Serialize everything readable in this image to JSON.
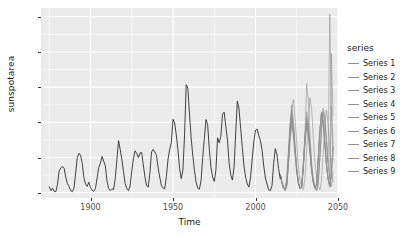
{
  "chart_data": {
    "type": "line",
    "title": "",
    "xlabel": "Time",
    "ylabel": "sunspotarea",
    "xlim": [
      1870,
      2050
    ],
    "ylim": [
      -150,
      5250
    ],
    "grid": true,
    "legend_position": "right",
    "legend_title": "series",
    "panel_background": "#ebebeb",
    "gridline_color": "#ffffff",
    "historical_color": "#222222",
    "forecast_color": "#8f8f8f",
    "x_ticks": [
      1900,
      1950,
      2000,
      2050
    ],
    "x_tick_labels": [
      "1900",
      "1950",
      "2000",
      "2050"
    ],
    "y_ticks": [
      0,
      1000,
      2000,
      3000,
      4000,
      5000
    ],
    "y_tick_labels": [
      "0",
      "1000",
      "2000",
      "3000",
      "4000",
      "5000"
    ],
    "legend_entries": [
      {
        "label": "Series 1",
        "color": "#8f8f8f"
      },
      {
        "label": "Series 2",
        "color": "#8f8f8f"
      },
      {
        "label": "Series 3",
        "color": "#8f8f8f"
      },
      {
        "label": "Series 4",
        "color": "#8f8f8f"
      },
      {
        "label": "Series 5",
        "color": "#8f8f8f"
      },
      {
        "label": "Series 6",
        "color": "#8f8f8f"
      },
      {
        "label": "Series 7",
        "color": "#8f8f8f"
      },
      {
        "label": "Series 8",
        "color": "#8f8f8f"
      },
      {
        "label": "Series 9",
        "color": "#8f8f8f"
      }
    ],
    "historical": {
      "name": "Observed sunspot area",
      "x": [
        1875,
        1876,
        1877,
        1878,
        1879,
        1880,
        1881,
        1882,
        1883,
        1884,
        1885,
        1886,
        1887,
        1888,
        1889,
        1890,
        1891,
        1892,
        1893,
        1894,
        1895,
        1896,
        1897,
        1898,
        1899,
        1900,
        1901,
        1902,
        1903,
        1904,
        1905,
        1906,
        1907,
        1908,
        1909,
        1910,
        1911,
        1912,
        1913,
        1914,
        1915,
        1916,
        1917,
        1918,
        1919,
        1920,
        1921,
        1922,
        1923,
        1924,
        1925,
        1926,
        1927,
        1928,
        1929,
        1930,
        1931,
        1932,
        1933,
        1934,
        1935,
        1936,
        1937,
        1938,
        1939,
        1940,
        1941,
        1942,
        1943,
        1944,
        1945,
        1946,
        1947,
        1948,
        1949,
        1950,
        1951,
        1952,
        1953,
        1954,
        1955,
        1956,
        1957,
        1958,
        1959,
        1960,
        1961,
        1962,
        1963,
        1964,
        1965,
        1966,
        1967,
        1968,
        1969,
        1970,
        1971,
        1972,
        1973,
        1974,
        1975,
        1976,
        1977,
        1978,
        1979,
        1980,
        1981,
        1982,
        1983,
        1984,
        1985,
        1986,
        1987,
        1988,
        1989,
        1990,
        1991,
        1992,
        1993,
        1994,
        1995,
        1996,
        1997,
        1998,
        1999,
        2000,
        2001,
        2002,
        2003,
        2004,
        2005,
        2006,
        2007,
        2008,
        2009,
        2010,
        2011,
        2012,
        2013,
        2014,
        2015
      ],
      "y": [
        170,
        60,
        130,
        40,
        30,
        240,
        620,
        700,
        750,
        700,
        440,
        260,
        180,
        60,
        30,
        130,
        560,
        1000,
        1120,
        1060,
        830,
        430,
        240,
        180,
        300,
        150,
        70,
        40,
        120,
        420,
        720,
        840,
        1030,
        900,
        760,
        330,
        120,
        60,
        110,
        90,
        400,
        940,
        1480,
        1230,
        950,
        600,
        260,
        120,
        60,
        190,
        620,
        960,
        1190,
        1120,
        1000,
        1130,
        1140,
        790,
        450,
        200,
        160,
        560,
        1160,
        1230,
        1150,
        1060,
        700,
        430,
        200,
        130,
        110,
        460,
        960,
        1230,
        1420,
        2090,
        1980,
        1640,
        1220,
        680,
        400,
        640,
        1640,
        3070,
        2970,
        2230,
        1560,
        1050,
        640,
        300,
        130,
        100,
        350,
        1000,
        1540,
        2080,
        1930,
        1240,
        720,
        450,
        320,
        640,
        1560,
        1420,
        1600,
        2230,
        2290,
        1890,
        1500,
        850,
        500,
        360,
        720,
        1700,
        2600,
        2390,
        1830,
        1290,
        760,
        440,
        250,
        160,
        440,
        960,
        1450,
        1780,
        1810,
        1620,
        1480,
        1200,
        760,
        420,
        240,
        80,
        60,
        200,
        830,
        1250,
        1090,
        680,
        400,
        520
      ]
    },
    "forecast_series": [
      {
        "name": "Series 1",
        "x": [
          2015,
          2016,
          2017,
          2018,
          2019,
          2020,
          2021,
          2022,
          2023,
          2024,
          2025,
          2026,
          2027,
          2028,
          2029,
          2030,
          2031,
          2032,
          2033,
          2034,
          2035,
          2036,
          2037,
          2038,
          2039,
          2040,
          2041,
          2042,
          2043,
          2044,
          2045,
          2046,
          2047
        ],
        "y": [
          520,
          300,
          140,
          60,
          240,
          900,
          1700,
          2380,
          2650,
          2100,
          1400,
          760,
          360,
          150,
          90,
          420,
          1200,
          2000,
          2700,
          2400,
          1600,
          900,
          420,
          180,
          80,
          320,
          1100,
          1900,
          2350,
          1900,
          1250,
          700,
          300
        ]
      },
      {
        "name": "Series 2",
        "x": [
          2015,
          2016,
          2017,
          2018,
          2019,
          2020,
          2021,
          2022,
          2023,
          2024,
          2025,
          2026,
          2027,
          2028,
          2029,
          2030,
          2031,
          2032,
          2033,
          2034,
          2035,
          2036,
          2037,
          2038,
          2039,
          2040,
          2041,
          2042,
          2043,
          2044,
          2045,
          2046,
          2047
        ],
        "y": [
          520,
          280,
          120,
          80,
          320,
          1050,
          1850,
          2200,
          1750,
          1200,
          640,
          280,
          120,
          200,
          780,
          1550,
          2100,
          1900,
          1300,
          700,
          340,
          140,
          60,
          260,
          950,
          1750,
          2280,
          2050,
          1450,
          800,
          400,
          3950,
          2200
        ]
      },
      {
        "name": "Series 3",
        "x": [
          2015,
          2016,
          2017,
          2018,
          2019,
          2020,
          2021,
          2022,
          2023,
          2024,
          2025,
          2026,
          2027,
          2028,
          2029,
          2030,
          2031,
          2032,
          2033,
          2034,
          2035,
          2036,
          2037,
          2038,
          2039,
          2040,
          2041,
          2042,
          2043,
          2044,
          2045,
          2046,
          2047
        ],
        "y": [
          520,
          320,
          160,
          70,
          200,
          820,
          1500,
          1900,
          1600,
          1050,
          560,
          240,
          110,
          160,
          700,
          1400,
          1850,
          1620,
          1100,
          600,
          280,
          120,
          220,
          900,
          1700,
          2200,
          1980,
          1380,
          780,
          380,
          160,
          520,
          1400
        ]
      },
      {
        "name": "Series 4",
        "x": [
          2015,
          2016,
          2017,
          2018,
          2019,
          2020,
          2021,
          2022,
          2023,
          2024,
          2025,
          2026,
          2027,
          2028,
          2029,
          2030,
          2031,
          2032,
          2033,
          2034,
          2035,
          2036,
          2037,
          2038,
          2039,
          2040,
          2041,
          2042,
          2043,
          2044,
          2045,
          2046,
          2047
        ],
        "y": [
          520,
          290,
          130,
          90,
          380,
          1150,
          1950,
          2350,
          1900,
          1280,
          680,
          300,
          130,
          180,
          820,
          1620,
          3100,
          2600,
          1700,
          880,
          420,
          180,
          70,
          300,
          1050,
          1850,
          2400,
          2150,
          1520,
          840,
          420,
          180,
          600
        ]
      },
      {
        "name": "Series 5",
        "x": [
          2015,
          2016,
          2017,
          2018,
          2019,
          2020,
          2021,
          2022,
          2023,
          2024,
          2025,
          2026,
          2027,
          2028,
          2029,
          2030,
          2031,
          2032,
          2033,
          2034,
          2035,
          2036,
          2037,
          2038,
          2039,
          2040,
          2041,
          2042,
          2043,
          2044,
          2045,
          2046,
          2047
        ],
        "y": [
          520,
          310,
          150,
          60,
          220,
          880,
          1620,
          2050,
          1680,
          1120,
          600,
          260,
          110,
          170,
          740,
          1480,
          1980,
          1720,
          1180,
          640,
          300,
          130,
          240,
          920,
          1720,
          2250,
          2020,
          1420,
          800,
          390,
          170,
          540,
          1250
        ]
      },
      {
        "name": "Series 6",
        "x": [
          2015,
          2016,
          2017,
          2018,
          2019,
          2020,
          2021,
          2022,
          2023,
          2024,
          2025,
          2026,
          2027,
          2028,
          2029,
          2030,
          2031,
          2032,
          2033,
          2034,
          2035,
          2036,
          2037,
          2038,
          2039,
          2040,
          2041,
          2042,
          2043,
          2044,
          2045,
          2046,
          2047
        ],
        "y": [
          520,
          270,
          110,
          100,
          420,
          1250,
          2050,
          2500,
          2020,
          1350,
          720,
          320,
          140,
          190,
          860,
          1700,
          2300,
          2000,
          1380,
          740,
          360,
          150,
          65,
          280,
          1000,
          1800,
          2320,
          2080,
          1480,
          820,
          5080,
          2400,
          900
        ]
      },
      {
        "name": "Series 7",
        "x": [
          2015,
          2016,
          2017,
          2018,
          2019,
          2020,
          2021,
          2022,
          2023,
          2024,
          2025,
          2026,
          2027,
          2028,
          2029,
          2030,
          2031,
          2032,
          2033,
          2034,
          2035,
          2036,
          2037,
          2038,
          2039,
          2040,
          2041,
          2042,
          2043,
          2044,
          2045,
          2046,
          2047
        ],
        "y": [
          520,
          330,
          170,
          75,
          260,
          950,
          1720,
          2150,
          1780,
          1180,
          620,
          270,
          120,
          175,
          760,
          1520,
          2020,
          1780,
          1220,
          660,
          310,
          135,
          230,
          940,
          1760,
          2280,
          2050,
          1440,
          810,
          400,
          175,
          560,
          1320
        ]
      },
      {
        "name": "Series 8",
        "x": [
          2015,
          2016,
          2017,
          2018,
          2019,
          2020,
          2021,
          2022,
          2023,
          2024,
          2025,
          2026,
          2027,
          2028,
          2029,
          2030,
          2031,
          2032,
          2033,
          2034,
          2035,
          2036,
          2037,
          2038,
          2039,
          2040,
          2041,
          2042,
          2043,
          2044,
          2045,
          2046,
          2047
        ],
        "y": [
          520,
          285,
          125,
          85,
          350,
          1100,
          1880,
          2280,
          1850,
          1240,
          660,
          290,
          125,
          185,
          800,
          1580,
          2150,
          1880,
          1280,
          700,
          330,
          145,
          250,
          960,
          1780,
          2300,
          2080,
          1460,
          820,
          410,
          180,
          2450,
          1400
        ]
      },
      {
        "name": "Series 9",
        "x": [
          2015,
          2016,
          2017,
          2018,
          2019,
          2020,
          2021,
          2022,
          2023,
          2024,
          2025,
          2026,
          2027,
          2028,
          2029,
          2030,
          2031,
          2032,
          2033,
          2034,
          2035,
          2036,
          2037,
          2038,
          2039,
          2040,
          2041,
          2042,
          2043,
          2044,
          2045,
          2046,
          2047
        ],
        "y": [
          520,
          305,
          145,
          65,
          230,
          900,
          1660,
          2100,
          1720,
          1150,
          610,
          265,
          115,
          172,
          750,
          1500,
          2000,
          1750,
          1200,
          650,
          305,
          132,
          235,
          930,
          1740,
          2260,
          2030,
          1430,
          805,
          395,
          172,
          550,
          1280
        ]
      }
    ]
  }
}
